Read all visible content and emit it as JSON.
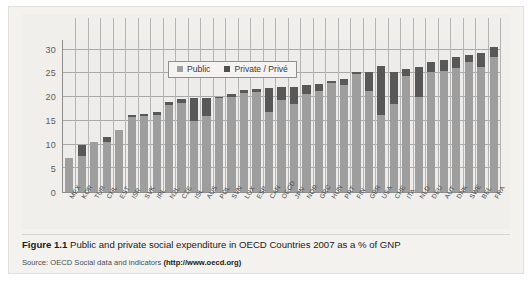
{
  "figure": {
    "caption_label": "Figure 1.1",
    "caption_text": " Public and private social expenditure in OECD Countries 2007 as a % of GNP",
    "source_prefix": "Source: OECD Social data and indicators ",
    "source_link": "(http://www.oecd.org)"
  },
  "legend": {
    "public_label": "Public",
    "private_label": "Private / Privé",
    "public_color": "#9e9e9e",
    "private_color": "#4f4f4f"
  },
  "chart_data": {
    "type": "bar",
    "title": "Public and private social expenditure in OECD Countries 2007 as a % of GNP",
    "xlabel": "",
    "ylabel": "",
    "ylim": [
      0,
      32
    ],
    "yticks": [
      0,
      5,
      10,
      15,
      20,
      25,
      30
    ],
    "grid": true,
    "stacked": true,
    "legend_position": "top-center",
    "categories": [
      "MEX",
      "KOR",
      "TUR",
      "CHL",
      "EST",
      "ISR",
      "SVK",
      "IRL",
      "NZL",
      "CZE",
      "ISL",
      "AUS",
      "POL",
      "SVN",
      "LUX",
      "ESP",
      "CAN",
      "OECD",
      "JPN",
      "NOR",
      "GRC",
      "HUN",
      "PRT",
      "FIN",
      "GBR",
      "USA",
      "CHE",
      "ITA",
      "NLD",
      "DEU",
      "AUT",
      "DNK",
      "SWE",
      "BEL",
      "FRA"
    ],
    "series": [
      {
        "name": "Public",
        "values": [
          7.2,
          7.5,
          10.5,
          10.6,
          13.0,
          15.8,
          16.0,
          16.3,
          18.4,
          18.8,
          15.0,
          16.0,
          19.8,
          20.0,
          20.8,
          21.0,
          16.9,
          19.3,
          18.6,
          20.6,
          21.3,
          22.9,
          22.5,
          24.8,
          21.3,
          16.2,
          18.5,
          24.4,
          20.1,
          25.2,
          25.4,
          26.1,
          27.3,
          26.3,
          28.4
        ]
      },
      {
        "name": "Private / Privé",
        "values": [
          0.0,
          2.5,
          0.0,
          1.0,
          0.0,
          0.4,
          0.5,
          0.5,
          0.5,
          0.8,
          4.7,
          3.7,
          0.3,
          0.6,
          0.6,
          0.7,
          4.9,
          2.8,
          3.6,
          2.0,
          1.5,
          0.5,
          1.4,
          0.5,
          4.0,
          10.3,
          6.7,
          1.6,
          6.3,
          2.2,
          2.4,
          2.3,
          1.5,
          3.0,
          2.1
        ]
      }
    ]
  }
}
